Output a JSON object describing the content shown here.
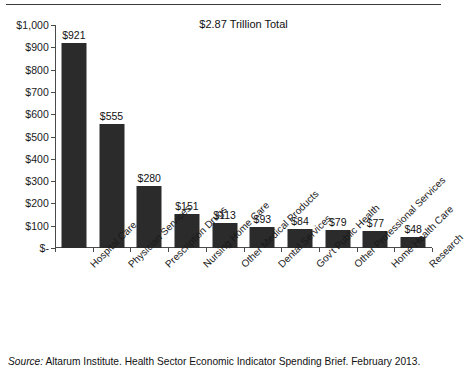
{
  "chart_data": {
    "type": "bar",
    "title": "$2.87 Trillion Total",
    "xlabel": "",
    "ylabel": "",
    "ylim": [
      0,
      1000
    ],
    "grid": false,
    "legend": "none",
    "categories": [
      "Hospital Care",
      "Physician Services",
      "Prescription Drugs",
      "Nursing Home Care",
      "Other Medical Products",
      "Dental Services",
      "Gov't Public Health",
      "Other Professional Services",
      "Home Health Care",
      "Research"
    ],
    "values": [
      921,
      555,
      280,
      151,
      113,
      93,
      84,
      79,
      77,
      48
    ],
    "value_labels": [
      "$921",
      "$555",
      "$280",
      "$151",
      "$113",
      "$93",
      "$84",
      "$79",
      "$77",
      "$48"
    ],
    "ytick_values": [
      0,
      100,
      200,
      300,
      400,
      500,
      600,
      700,
      800,
      900,
      1000
    ],
    "ytick_labels": [
      "$-",
      "$100",
      "$200",
      "$300",
      "$400",
      "$500",
      "$600",
      "$700",
      "$800",
      "$900",
      "$1,000"
    ],
    "bar_color": "#2b2b2b",
    "axis_color": "#4a4a4a"
  },
  "source": {
    "lead": "Source:",
    "text": " Altarum Institute. Health Sector Economic Indicator Spending Brief. February 2013."
  }
}
